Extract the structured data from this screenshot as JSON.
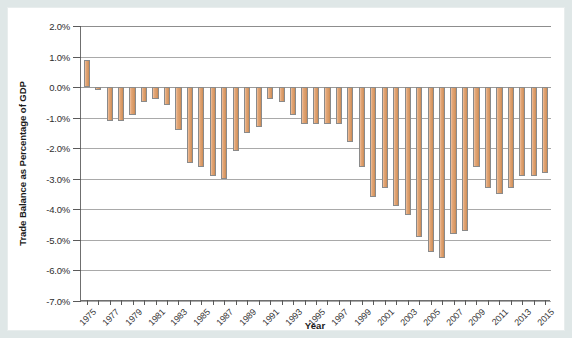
{
  "figure": {
    "background_color": "#ffffff",
    "page_background_color": "#dfe7e7",
    "bar_color": "#d99a66",
    "bar_edge_color": "#8a8a8a",
    "axis_color": "#6f6f6f",
    "grid_color": "#a9a9a9"
  },
  "axes": {
    "y_title": "Trade Balance as Percentage of GDP",
    "x_title": "Year"
  },
  "chart_data": {
    "type": "bar",
    "title": "",
    "xlabel": "Year",
    "ylabel": "Trade Balance as Percentage of GDP",
    "ylim": [
      -7.0,
      2.0
    ],
    "ytick_values": [
      2.0,
      1.0,
      0.0,
      -1.0,
      -2.0,
      -3.0,
      -4.0,
      -5.0,
      -6.0,
      -7.0
    ],
    "ytick_labels": [
      "2.0%",
      "1.0%",
      "0.0%",
      "-1.0%",
      "-2.0%",
      "-3.0%",
      "-4.0%",
      "-5.0%",
      "-6.0%",
      "-7.0%"
    ],
    "grid": true,
    "grid_axis": "y",
    "legend": false,
    "xlim": [
      1974.5,
      2015.5
    ],
    "xtick_labels": [
      "1975",
      "1977",
      "1979",
      "1981",
      "1983",
      "1985",
      "1987",
      "1989",
      "1991",
      "1993",
      "1995",
      "1997",
      "1999",
      "2001",
      "2003",
      "2005",
      "2007",
      "2009",
      "2011",
      "2013",
      "2015"
    ],
    "xtick_label_rotation": -45,
    "categories": [
      1975,
      1976,
      1977,
      1978,
      1979,
      1980,
      1981,
      1982,
      1983,
      1984,
      1985,
      1986,
      1987,
      1988,
      1989,
      1990,
      1991,
      1992,
      1993,
      1994,
      1995,
      1996,
      1997,
      1998,
      1999,
      2000,
      2001,
      2002,
      2003,
      2004,
      2005,
      2006,
      2007,
      2008,
      2009,
      2010,
      2011,
      2012,
      2013,
      2014,
      2015
    ],
    "values": [
      0.9,
      -0.1,
      -1.1,
      -1.1,
      -0.9,
      -0.5,
      -0.4,
      -0.6,
      -1.4,
      -2.5,
      -2.6,
      -2.9,
      -3.0,
      -2.1,
      -1.5,
      -1.3,
      -0.4,
      -0.5,
      -0.9,
      -1.2,
      -1.2,
      -1.2,
      -1.2,
      -1.8,
      -2.6,
      -3.6,
      -3.3,
      -3.9,
      -4.2,
      -4.9,
      -5.4,
      -5.6,
      -4.8,
      -4.7,
      -2.6,
      -3.3,
      -3.5,
      -3.3,
      -2.9,
      -2.9,
      -2.8
    ],
    "units": "percent of GDP"
  }
}
